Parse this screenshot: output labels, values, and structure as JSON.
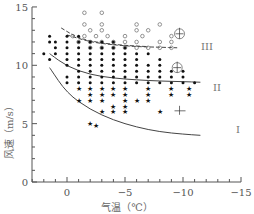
{
  "chart_data": {
    "type": "scatter",
    "title": "",
    "xlabel": "气温（℃）",
    "ylabel": "风速（m/s）",
    "xlim": [
      2,
      -15
    ],
    "ylim": [
      0,
      15
    ],
    "x_ticks": [
      0,
      -5,
      -10,
      -15
    ],
    "x_tick_labels": [
      "0",
      "−5",
      "−10",
      "−15"
    ],
    "y_ticks": [
      0,
      5,
      10,
      15
    ],
    "y_tick_labels": [
      "0",
      "5",
      "10",
      "15"
    ],
    "grid": false,
    "legend": "none",
    "axis_reversed_x": true,
    "curve_labels": [
      "I",
      "II",
      "III"
    ],
    "curves": [
      {
        "name": "I",
        "style": "solid",
        "points": [
          [
            -1.5,
            9.8
          ],
          [
            0,
            7.6
          ],
          [
            2,
            6.2
          ],
          [
            4,
            5.3
          ],
          [
            6,
            4.7
          ],
          [
            8,
            4.3
          ],
          [
            10,
            4.1
          ],
          [
            11.5,
            4.0
          ]
        ]
      },
      {
        "name": "II",
        "style": "solid",
        "points": [
          [
            -1.5,
            11.0
          ],
          [
            0,
            9.9
          ],
          [
            2,
            9.2
          ],
          [
            4,
            8.9
          ],
          [
            6,
            8.75
          ],
          [
            8,
            8.65
          ],
          [
            10,
            8.6
          ],
          [
            11.5,
            8.55
          ]
        ]
      },
      {
        "name": "III",
        "style": "dashed",
        "points": [
          [
            0,
            12.6
          ],
          [
            2,
            12.0
          ],
          [
            4,
            11.75
          ],
          [
            6,
            11.6
          ],
          [
            8,
            11.55
          ],
          [
            9.5,
            11.5
          ]
        ]
      },
      {
        "name": "upper-boundary",
        "style": "dashed",
        "points": [
          [
            -0.5,
            13.2
          ],
          [
            1,
            12.3
          ],
          [
            3,
            11.9
          ],
          [
            5,
            11.7
          ],
          [
            7,
            11.6
          ]
        ]
      }
    ],
    "series": [
      {
        "name": "open-circles",
        "marker": "circle-open",
        "points": [
          [
            1.5,
            14.5
          ],
          [
            3,
            14.5
          ],
          [
            1.5,
            13.5
          ],
          [
            3,
            13.5
          ],
          [
            6,
            13.5
          ],
          [
            8,
            13.5
          ],
          [
            2,
            13
          ],
          [
            3,
            13
          ],
          [
            6,
            13
          ],
          [
            7,
            13
          ],
          [
            0.5,
            12.5
          ],
          [
            1.5,
            12.5
          ],
          [
            2.5,
            12.5
          ],
          [
            3.5,
            12.5
          ],
          [
            5,
            12.5
          ],
          [
            6.5,
            12.5
          ],
          [
            9,
            12.5
          ],
          [
            1,
            12
          ],
          [
            2,
            12
          ],
          [
            3,
            12
          ],
          [
            4,
            12
          ],
          [
            5,
            12
          ],
          [
            6,
            12
          ],
          [
            8,
            12
          ],
          [
            9,
            12
          ],
          [
            2,
            11.5
          ],
          [
            3,
            11.5
          ],
          [
            4,
            11.5
          ],
          [
            5,
            11.5
          ],
          [
            6,
            11.5
          ],
          [
            7,
            11.5
          ],
          [
            8,
            11.5
          ],
          [
            9,
            11.5
          ]
        ]
      },
      {
        "name": "filled-dots",
        "marker": "dot",
        "points": [
          [
            -1.5,
            12.5
          ],
          [
            0,
            12.5
          ],
          [
            1,
            12.5
          ],
          [
            -1.5,
            12
          ],
          [
            -1,
            12
          ],
          [
            0,
            12
          ],
          [
            1,
            12
          ],
          [
            2,
            12
          ],
          [
            3,
            12
          ],
          [
            4,
            12
          ],
          [
            -1,
            11.5
          ],
          [
            0,
            11.5
          ],
          [
            1,
            11.5
          ],
          [
            2,
            11.5
          ],
          [
            3,
            11.5
          ],
          [
            4,
            11.5
          ],
          [
            5,
            11.5
          ],
          [
            -2,
            11
          ],
          [
            -1,
            11
          ],
          [
            0,
            11
          ],
          [
            1,
            11
          ],
          [
            2,
            11
          ],
          [
            3,
            11
          ],
          [
            4,
            11
          ],
          [
            5,
            11
          ],
          [
            6,
            11
          ],
          [
            7,
            11
          ],
          [
            -1.5,
            10.5
          ],
          [
            0,
            10.5
          ],
          [
            1,
            10.5
          ],
          [
            2,
            10.5
          ],
          [
            3,
            10.5
          ],
          [
            4,
            10.5
          ],
          [
            5,
            10.5
          ],
          [
            6,
            10.5
          ],
          [
            8,
            10.5
          ],
          [
            0,
            10
          ],
          [
            1,
            10
          ],
          [
            2,
            10
          ],
          [
            3,
            10
          ],
          [
            4,
            10
          ],
          [
            5,
            10
          ],
          [
            6,
            10
          ],
          [
            7,
            10
          ],
          [
            8,
            10
          ],
          [
            1,
            9.5
          ],
          [
            2,
            9.5
          ],
          [
            3,
            9.5
          ],
          [
            4,
            9.5
          ],
          [
            5,
            9.5
          ],
          [
            6,
            9.5
          ],
          [
            7,
            9.5
          ],
          [
            8,
            9.5
          ],
          [
            9,
            9.5
          ],
          [
            10,
            9.5
          ],
          [
            0,
            9
          ],
          [
            1,
            9
          ],
          [
            2,
            9
          ],
          [
            3,
            9
          ],
          [
            4,
            9
          ],
          [
            5,
            9
          ],
          [
            6,
            9
          ],
          [
            7,
            9
          ],
          [
            8,
            9
          ],
          [
            9,
            9
          ],
          [
            10,
            9
          ],
          [
            0,
            8.5
          ],
          [
            1,
            8.5
          ],
          [
            2,
            8.5
          ],
          [
            3,
            8.5
          ],
          [
            4,
            8.5
          ],
          [
            5,
            8.5
          ],
          [
            6,
            8.5
          ],
          [
            7,
            8.5
          ],
          [
            8,
            8.5
          ],
          [
            9,
            8.5
          ],
          [
            10,
            8.5
          ],
          [
            11,
            8.5
          ]
        ]
      },
      {
        "name": "stars",
        "marker": "star",
        "points": [
          [
            1,
            8
          ],
          [
            2,
            8
          ],
          [
            3,
            8
          ],
          [
            4,
            8
          ],
          [
            5,
            8
          ],
          [
            7,
            8
          ],
          [
            9,
            8
          ],
          [
            10.5,
            8
          ],
          [
            2,
            7.5
          ],
          [
            3,
            7.5
          ],
          [
            4,
            7.5
          ],
          [
            5,
            7.5
          ],
          [
            7,
            7.5
          ],
          [
            9,
            7.5
          ],
          [
            10.5,
            7.5
          ],
          [
            1,
            7
          ],
          [
            2,
            7
          ],
          [
            3,
            7
          ],
          [
            5,
            7
          ],
          [
            6,
            7
          ],
          [
            7,
            7
          ],
          [
            4,
            6.5
          ],
          [
            5,
            6.5
          ],
          [
            3,
            6
          ],
          [
            4,
            6
          ],
          [
            5,
            6
          ],
          [
            8,
            6
          ],
          [
            2,
            5
          ],
          [
            2.5,
            4.8
          ]
        ]
      }
    ],
    "annotations": [
      {
        "type": "wind-symbol-circle",
        "x": 9.7,
        "y": 12.7
      },
      {
        "type": "wind-symbol-circle",
        "x": 9.5,
        "y": 9.8
      },
      {
        "type": "wind-symbol-cross",
        "x": 9.7,
        "y": 6.1
      }
    ]
  }
}
